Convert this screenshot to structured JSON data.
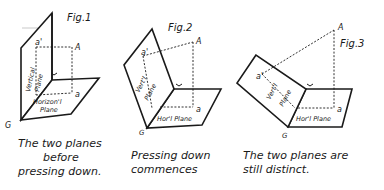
{
  "figures": [
    {
      "title": "Fig.1",
      "point_A": "A",
      "point_a_prime": "a'",
      "point_a": "a",
      "ground_line": "G",
      "vertical_plane_label": [
        "Vertical",
        "Plane"
      ],
      "horizontal_plane_label": [
        "Horizon'l",
        "Plane"
      ],
      "caption": [
        "The two planes",
        "before",
        "pressing down."
      ]
    },
    {
      "title": "Fig.2",
      "point_A": "A",
      "point_a_prime": "a'",
      "point_a": "a",
      "ground_line": "G",
      "vertical_plane_label": [
        "Vert'l",
        "Plane"
      ],
      "horizontal_plane_label": [
        "Hor'l Plane"
      ],
      "caption": [
        "Pressing down",
        "commences"
      ]
    },
    {
      "title": "Fig.3",
      "point_A": "A",
      "point_a_prime": "a'",
      "point_a": "a",
      "ground_line": "G",
      "vertical_plane_label": [
        "Vert'l",
        "Plane"
      ],
      "horizontal_plane_label": [
        "Hor'l Plane"
      ],
      "caption": [
        "The two planes are",
        "still distinct."
      ]
    }
  ],
  "colors": {
    "ink": "#1a1a1a",
    "background": "#ffffff"
  }
}
